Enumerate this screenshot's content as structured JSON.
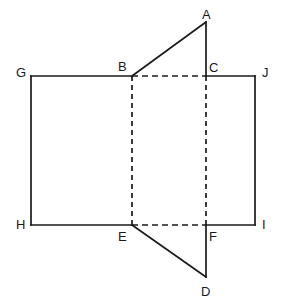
{
  "figure": {
    "background_color": "#ffffff",
    "stroke_color": "#1a1a1a",
    "canvas": {
      "width": 283,
      "height": 305
    },
    "label_font_size_px": 13,
    "points": {
      "A": {
        "label": "A",
        "x": 206,
        "y": 22,
        "label_x": 202,
        "label_y": 8
      },
      "B": {
        "label": "B",
        "x": 132,
        "y": 76,
        "label_x": 118,
        "label_y": 60
      },
      "C": {
        "label": "C",
        "x": 206,
        "y": 76,
        "label_x": 209,
        "label_y": 61
      },
      "D": {
        "label": "D",
        "x": 206,
        "y": 277,
        "label_x": 201,
        "label_y": 285
      },
      "E": {
        "label": "E",
        "x": 132,
        "y": 225,
        "label_x": 118,
        "label_y": 230
      },
      "F": {
        "label": "F",
        "x": 206,
        "y": 225,
        "label_x": 209,
        "label_y": 230
      },
      "G": {
        "label": "G",
        "x": 31,
        "y": 76,
        "label_x": 16,
        "label_y": 66
      },
      "H": {
        "label": "H",
        "x": 31,
        "y": 225,
        "label_x": 16,
        "label_y": 218
      },
      "I": {
        "label": "I",
        "x": 255,
        "y": 225,
        "label_x": 262,
        "label_y": 218
      },
      "J": {
        "label": "J",
        "x": 255,
        "y": 76,
        "label_x": 262,
        "label_y": 66
      }
    },
    "edges_solid": [
      {
        "name": "edge-G-B",
        "from": "G",
        "to": "B"
      },
      {
        "name": "edge-C-J",
        "from": "C",
        "to": "J"
      },
      {
        "name": "edge-J-I",
        "from": "J",
        "to": "I"
      },
      {
        "name": "edge-I-F",
        "from": "I",
        "to": "F"
      },
      {
        "name": "edge-H-E",
        "from": "H",
        "to": "E"
      },
      {
        "name": "edge-G-H",
        "from": "G",
        "to": "H"
      },
      {
        "name": "edge-B-A",
        "from": "B",
        "to": "A"
      },
      {
        "name": "edge-A-C",
        "from": "A",
        "to": "C"
      },
      {
        "name": "edge-E-D",
        "from": "E",
        "to": "D"
      },
      {
        "name": "edge-D-F",
        "from": "D",
        "to": "F"
      }
    ],
    "edges_dashed": [
      {
        "name": "edge-B-C",
        "from": "B",
        "to": "C"
      },
      {
        "name": "edge-E-F",
        "from": "E",
        "to": "F"
      },
      {
        "name": "edge-B-E",
        "from": "B",
        "to": "E"
      },
      {
        "name": "edge-C-F",
        "from": "C",
        "to": "F"
      }
    ]
  }
}
